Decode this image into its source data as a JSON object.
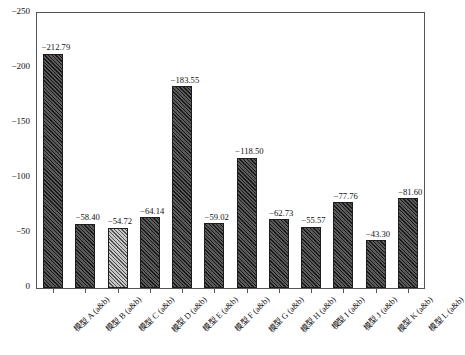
{
  "chart_data": {
    "type": "bar",
    "title": "",
    "subtitle": "",
    "xlabel": "",
    "ylabel": "E_ads (kJ/mol)",
    "ylabel_main": "E",
    "ylabel_sub": "ads",
    "ylabel_unit": " (kJ/mol)",
    "ylim": [
      0,
      -250
    ],
    "y_inverted": true,
    "grid": false,
    "legend": null,
    "ytick_labels": [
      "0",
      "−50",
      "−100",
      "−150",
      "−200",
      "−250"
    ],
    "ytick_values": [
      0,
      -50,
      -100,
      -150,
      -200,
      -250
    ],
    "categories": [
      "模型 A (a&b)",
      "模型 B (a&b)",
      "模型 C (a&b)",
      "模型 D (a&b)",
      "模型 E (a&b)",
      "模型 F (a&b)",
      "模型 G (a&b)",
      "模型 H (a&b)",
      "模型 I (a&b)",
      "模型 J (a&b)",
      "模型 K (a&b)",
      "模型 L (a&b)"
    ],
    "values": [
      -212.79,
      -58.4,
      -54.72,
      -64.14,
      -183.55,
      -59.02,
      -118.5,
      -62.73,
      -55.57,
      -77.76,
      -43.3,
      -81.6
    ],
    "value_labels": [
      "−212.79",
      "−58.40",
      "−54.72",
      "−64.14",
      "−183.55",
      "−59.02",
      "−118.50",
      "−62.73",
      "−55.57",
      "−77.76",
      "−43.30",
      "−81.60"
    ],
    "bar_styles": [
      "dark",
      "dark",
      "light",
      "dark",
      "dark",
      "dark",
      "dark",
      "dark",
      "dark",
      "dark",
      "dark",
      "dark"
    ],
    "colors": {
      "bar_dark": "#3a3a3a",
      "bar_light": "#8e8e8e",
      "bar_edge": "#1c1c1c",
      "axis": "#555555",
      "text": "#111111",
      "background": "#ffffff"
    }
  }
}
